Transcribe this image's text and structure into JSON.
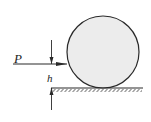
{
  "diagram": {
    "labels": {
      "force": "P",
      "height": "h"
    },
    "colors": {
      "stroke": "#2a2a2a",
      "cylinder_fill": "#ececec",
      "background": "#ffffff"
    },
    "elements": [
      "cylinder",
      "force-arrow-P",
      "step-edge",
      "ground-hatching",
      "height-dimension-h"
    ]
  }
}
